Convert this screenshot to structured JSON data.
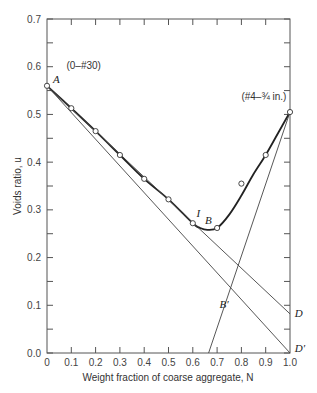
{
  "chart_data": {
    "type": "line",
    "title": "",
    "xlabel": "Weight fraction of coarse aggregate, N",
    "ylabel": "Voids ratio, u",
    "xlim": [
      0,
      1.0
    ],
    "ylim": [
      0,
      0.7
    ],
    "x_ticks": [
      "0",
      "0.1",
      "0.2",
      "0.3",
      "0.4",
      "0.5",
      "0.6",
      "0.7",
      "0.8",
      "0.9",
      "1.0"
    ],
    "y_ticks": [
      "0.0",
      "0.1",
      "0.2",
      "0.3",
      "0.4",
      "0.5",
      "0.6",
      "0.7"
    ],
    "x_tick_values": [
      0,
      0.1,
      0.2,
      0.3,
      0.4,
      0.5,
      0.6,
      0.7,
      0.8,
      0.9,
      1.0
    ],
    "y_tick_values": [
      0,
      0.1,
      0.2,
      0.3,
      0.4,
      0.5,
      0.6,
      0.7
    ],
    "grid": false,
    "series": [
      {
        "name": "Measured voids ratio",
        "style": "points",
        "x": [
          0,
          0.1,
          0.2,
          0.3,
          0.4,
          0.5,
          0.6,
          0.7,
          0.8,
          0.9,
          1.0
        ],
        "y": [
          0.56,
          0.513,
          0.465,
          0.415,
          0.365,
          0.322,
          0.272,
          0.262,
          0.355,
          0.415,
          0.505
        ]
      },
      {
        "name": "Fitted curve A-I-B",
        "style": "thick-curve",
        "x": [
          0,
          0.1,
          0.2,
          0.3,
          0.4,
          0.5,
          0.6,
          0.63,
          0.66,
          0.7,
          0.75,
          0.8,
          0.85,
          0.9,
          0.95,
          1.0
        ],
        "y": [
          0.56,
          0.513,
          0.465,
          0.415,
          0.365,
          0.322,
          0.272,
          0.262,
          0.258,
          0.262,
          0.29,
          0.33,
          0.375,
          0.415,
          0.46,
          0.505
        ]
      },
      {
        "name": "Line A-D",
        "style": "thin-line",
        "x": [
          0,
          1.0
        ],
        "y": [
          0.56,
          0.082
        ]
      },
      {
        "name": "Line A-D'",
        "style": "thin-line",
        "x": [
          0,
          1.0
        ],
        "y": [
          0.56,
          0.0
        ]
      },
      {
        "name": "Line B'",
        "style": "thin-line",
        "x": [
          0.665,
          1.0
        ],
        "y": [
          0.0,
          0.505
        ]
      }
    ],
    "annotations": [
      {
        "text": "(0–#30)",
        "x": 0.08,
        "y": 0.595,
        "kind": "note"
      },
      {
        "text": "(#4–¾ in.)",
        "x": 0.8,
        "y": 0.53,
        "kind": "note"
      },
      {
        "text": "A",
        "x": 0.025,
        "y": 0.565,
        "kind": "point"
      },
      {
        "text": "I",
        "x": 0.615,
        "y": 0.285,
        "kind": "point"
      },
      {
        "text": "B",
        "x": 0.65,
        "y": 0.27,
        "kind": "point"
      },
      {
        "text": "B′",
        "x": 0.71,
        "y": 0.095,
        "kind": "point"
      },
      {
        "text": "D",
        "x": 1.02,
        "y": 0.075,
        "kind": "point"
      },
      {
        "text": "D′",
        "x": 1.02,
        "y": 0.003,
        "kind": "point"
      }
    ]
  }
}
